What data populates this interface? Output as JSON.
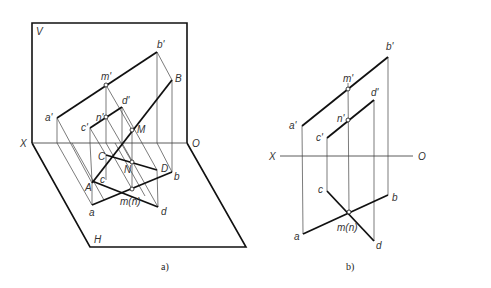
{
  "figure_a": {
    "caption": "a)",
    "planes": {
      "V": "V",
      "H": "H"
    },
    "axis": {
      "X": "X",
      "O": "O"
    },
    "points": {
      "a_prime": "a'",
      "b_prime": "b'",
      "c_prime": "c'",
      "d_prime": "d'",
      "m_prime": "m'",
      "n_prime": "n'",
      "A": "A",
      "B": "B",
      "C": "C",
      "D": "D",
      "M": "M",
      "N": "N",
      "a": "a",
      "b": "b",
      "c": "c",
      "d": "d",
      "mn": "m(n)"
    }
  },
  "figure_b": {
    "caption": "b)",
    "axis": {
      "X": "X",
      "O": "O"
    },
    "points": {
      "a_prime": "a'",
      "b_prime": "b'",
      "c_prime": "c'",
      "d_prime": "d'",
      "m_prime": "m'",
      "n_prime": "n'",
      "a": "a",
      "b": "b",
      "c": "c",
      "d": "d",
      "mn": "m(n)"
    }
  },
  "colors": {
    "line": "#111111",
    "thin": "#444444",
    "label": "#333333"
  }
}
